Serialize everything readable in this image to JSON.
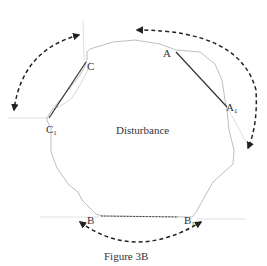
{
  "figure": {
    "caption": "Figure 3B",
    "center_label": "Disturbance",
    "points": {
      "A": {
        "label": "A",
        "sub": ""
      },
      "A1": {
        "label": "A",
        "sub": "1"
      },
      "B": {
        "label": "B",
        "sub": ""
      },
      "B1": {
        "label": "B",
        "sub": "1"
      },
      "C": {
        "label": "C",
        "sub": ""
      },
      "C1": {
        "label": "C",
        "sub": "1"
      }
    },
    "colors": {
      "outline": "#b5b5b5",
      "chord": "#333333",
      "arc": "#222222",
      "guide": "#d8d8d8"
    }
  }
}
